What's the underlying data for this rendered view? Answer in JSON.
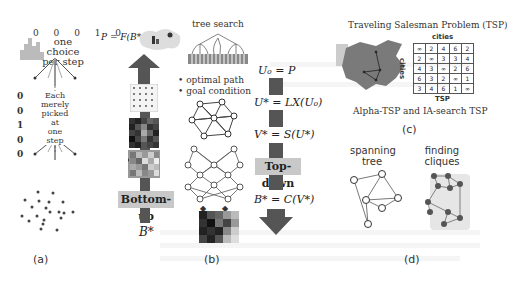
{
  "panels": {
    "a": {
      "label": "(a)",
      "bits_top": "0 0 0 1 0",
      "caption_top": [
        "one choice",
        "per step"
      ],
      "bits_column": [
        "0",
        "0",
        "1",
        "0",
        "0"
      ],
      "caption_middle": [
        "Each",
        "merely",
        "picked at",
        "one step"
      ]
    },
    "b": {
      "label": "(b)",
      "formula_top": "P = F(B*, θ)",
      "tree_search_label": "tree search",
      "bullets": [
        "optimal path",
        "goal condition"
      ],
      "bottom_up_label": "Bottom-up",
      "bottom_var": "B*"
    },
    "top_down": {
      "equations": [
        "U₀ = P",
        "U* = LX(U₀)",
        "V* = S(U*)",
        "B* = C(V*)"
      ],
      "label": "Top-down"
    },
    "c": {
      "label": "(c)",
      "title": "Traveling Salesman Problem (TSP)",
      "table_col_header": "cities",
      "table_row_header": "cities",
      "table_caption": "TSP",
      "matrix": [
        [
          "∞",
          "2",
          "4",
          "6",
          "2"
        ],
        [
          "2",
          "∞",
          "3",
          "3",
          "4"
        ],
        [
          "4",
          "3",
          "∞",
          "2",
          "6"
        ],
        [
          "6",
          "3",
          "2",
          "∞",
          "1"
        ],
        [
          "3",
          "4",
          "6",
          "1",
          "∞"
        ]
      ],
      "subtitle": "Alpha-TSP and IA-search TSP"
    },
    "d": {
      "label": "(d)",
      "left_title": [
        "spanning",
        "tree"
      ],
      "right_title": [
        "finding",
        "cliques"
      ]
    }
  },
  "colors": {
    "dark_bar": "#555555",
    "label_box": "#c8c8c8",
    "map_gray": "#7a7a7a",
    "node_dark": "#555555"
  }
}
